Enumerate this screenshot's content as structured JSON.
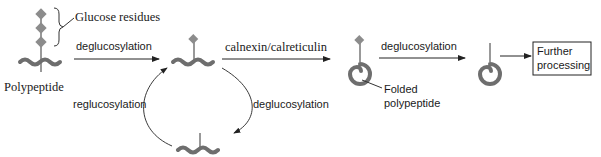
{
  "labels": {
    "glucose_residues": "Glucose residues",
    "polypeptide": "Polypeptide",
    "deglucosylation_1": "deglucosylation",
    "calnexin": "calnexin/calreticulin",
    "deglucosylation_2": "deglucosylation",
    "deglucosylation_3": "deglucosylation",
    "reglucosylation": "reglucosylation",
    "folded_line1": "Folded",
    "folded_line2": "polypeptide",
    "further_line1": "Further",
    "further_line2": "processing"
  },
  "colors": {
    "polypeptide": "#6e6e6e",
    "glucose": "#8c8c8c",
    "arrow": "#222222"
  }
}
